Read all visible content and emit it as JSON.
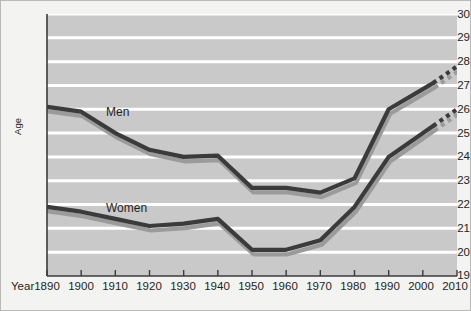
{
  "chart_data": {
    "type": "line",
    "title": "",
    "xlabel": "Year",
    "ylabel": "Age",
    "xlim": [
      1890,
      2010
    ],
    "ylim": [
      19,
      30
    ],
    "grid": true,
    "legend_position": "inline-annotations",
    "x_tick_labels": [
      "1890",
      "1900",
      "1910",
      "1920",
      "1930",
      "1940",
      "1950",
      "1960",
      "1970",
      "1980",
      "1990",
      "2000",
      "2010"
    ],
    "y_tick_labels": [
      "19",
      "20",
      "21",
      "22",
      "23",
      "24",
      "25",
      "26",
      "27",
      "28",
      "29",
      "30"
    ],
    "x": [
      1890,
      1900,
      1910,
      1920,
      1930,
      1940,
      1950,
      1960,
      1970,
      1980,
      1990,
      2003
    ],
    "series": [
      {
        "name": "Men",
        "color": "#3b3b3b",
        "shadow_color": "#9b9b9b",
        "values": [
          26.1,
          25.9,
          25.0,
          24.3,
          24.0,
          24.05,
          22.7,
          22.7,
          22.5,
          23.1,
          26.0,
          27.1
        ],
        "projection": {
          "x": [
            2003,
            2010
          ],
          "values": [
            27.1,
            27.8
          ],
          "style": "dotted"
        }
      },
      {
        "name": "Women",
        "color": "#3b3b3b",
        "shadow_color": "#9b9b9b",
        "values": [
          21.9,
          21.7,
          21.4,
          21.1,
          21.2,
          21.4,
          20.1,
          20.1,
          20.5,
          21.9,
          24.0,
          25.3
        ],
        "projection": {
          "x": [
            2003,
            2010
          ],
          "values": [
            25.3,
            26.0
          ],
          "style": "dotted"
        }
      }
    ],
    "annotations": [
      {
        "text": "Men",
        "x": 1904,
        "y": 25.6
      },
      {
        "text": "Women",
        "x": 1904,
        "y": 21.95
      }
    ],
    "colors": {
      "plot_background": "#c9c9c9",
      "figure_background": "#f3f3f2",
      "gridline": "#ffffff",
      "axis": "#3b3b3b",
      "text": "#231f20"
    }
  },
  "axes": {
    "year_label": "Year",
    "age_label": "Age"
  }
}
